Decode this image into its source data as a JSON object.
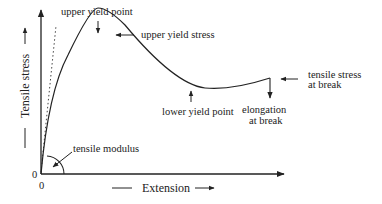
{
  "diagram": {
    "x_axis": {
      "label": "Extension",
      "origin_label": "0"
    },
    "y_axis": {
      "label": "Tensile stress",
      "origin_label": "0"
    },
    "annotations": {
      "upper_yield_point": "upper yield point",
      "upper_yield_stress": "upper yield stress",
      "lower_yield_point": "lower yield point",
      "elongation_at_break_1": "elongation",
      "elongation_at_break_2": "at break",
      "tensile_stress_at_break_1": "tensile stress",
      "tensile_stress_at_break_2": "at break",
      "tensile_modulus": "tensile modulus"
    },
    "colors": {
      "ink": "#222222",
      "background": "#ffffff"
    }
  }
}
